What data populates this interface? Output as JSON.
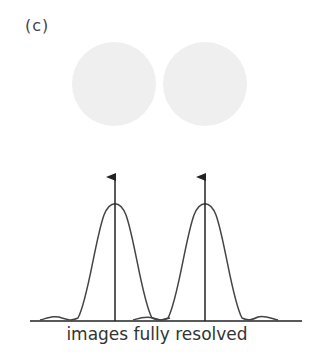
{
  "panel": {
    "label": "(c)"
  },
  "discs": [
    {
      "cx": 114,
      "cy": 84,
      "r": 42,
      "color": "#efefef"
    },
    {
      "cx": 205,
      "cy": 84,
      "r": 42,
      "color": "#efefef"
    }
  ],
  "profile": {
    "caption": "images fully resolved",
    "line_color": "#333333",
    "peaks_x": [
      115,
      205
    ],
    "baseline_y": 321
  }
}
